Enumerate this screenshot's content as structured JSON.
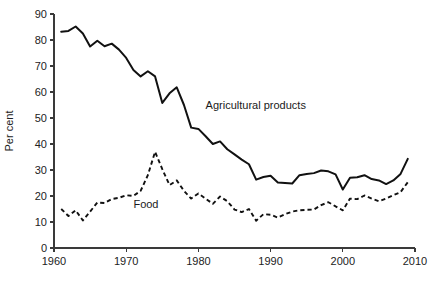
{
  "chart_data": {
    "type": "line",
    "title": "",
    "subtitle": "",
    "xlabel": "",
    "ylabel": "Per cent",
    "xlim": [
      1960,
      2010
    ],
    "ylim": [
      0,
      90
    ],
    "grid": false,
    "legend_position": "inline-annotations",
    "xticks": [
      "1960",
      "1970",
      "1980",
      "1990",
      "2000",
      "2010"
    ],
    "xtick_values": [
      1960,
      1970,
      1980,
      1990,
      2000,
      2010
    ],
    "yticks": [
      "0",
      "10",
      "20",
      "30",
      "40",
      "50",
      "60",
      "70",
      "80",
      "90"
    ],
    "ytick_values": [
      0,
      10,
      20,
      30,
      40,
      50,
      60,
      70,
      80,
      90
    ],
    "x": [
      1961,
      1962,
      1963,
      1964,
      1965,
      1966,
      1967,
      1968,
      1969,
      1970,
      1971,
      1972,
      1973,
      1974,
      1975,
      1976,
      1977,
      1978,
      1979,
      1980,
      1981,
      1982,
      1983,
      1984,
      1985,
      1986,
      1987,
      1988,
      1989,
      1990,
      1991,
      1992,
      1993,
      1994,
      1995,
      1996,
      1997,
      1998,
      1999,
      2000,
      2001,
      2002,
      2003,
      2004,
      2005,
      2006,
      2007,
      2008,
      2009
    ],
    "series": [
      {
        "name": "Agricultural products",
        "style": "solid",
        "color": "#111111",
        "annotation_label": "Agricultural products",
        "values": [
          83.2,
          83.5,
          85.2,
          82.5,
          77.5,
          79.7,
          77.6,
          78.6,
          76.3,
          73.1,
          68.5,
          66.0,
          68.0,
          66.0,
          55.8,
          59.5,
          61.8,
          55.0,
          46.3,
          45.8,
          43.0,
          40.0,
          41.0,
          38.0,
          36.0,
          34.0,
          32.2,
          26.3,
          27.3,
          27.8,
          25.2,
          25.0,
          24.8,
          28.0,
          28.5,
          28.8,
          29.8,
          29.5,
          28.3,
          22.5,
          27.0,
          27.2,
          28.0,
          26.5,
          26.0,
          24.6,
          26.0,
          28.5,
          34.3
        ]
      },
      {
        "name": "Food",
        "style": "dashed",
        "color": "#111111",
        "annotation_label": "Food",
        "values": [
          15.0,
          12.3,
          14.5,
          10.6,
          14.0,
          17.5,
          17.3,
          18.8,
          19.3,
          20.3,
          20.0,
          22.0,
          28.0,
          37.0,
          30.3,
          24.2,
          26.0,
          22.0,
          19.0,
          21.0,
          19.0,
          17.0,
          19.8,
          18.0,
          14.8,
          13.8,
          15.0,
          10.5,
          13.0,
          12.8,
          11.7,
          13.0,
          14.0,
          14.5,
          14.7,
          14.8,
          16.5,
          17.6,
          16.0,
          14.5,
          19.0,
          18.8,
          20.2,
          19.0,
          18.0,
          19.0,
          20.3,
          21.5,
          25.3
        ]
      }
    ],
    "annotations": [
      {
        "text": "Agricultural products",
        "x": 1981.0,
        "y": 53.5
      },
      {
        "text": "Food",
        "x": 1971.0,
        "y": 15.5
      }
    ]
  }
}
